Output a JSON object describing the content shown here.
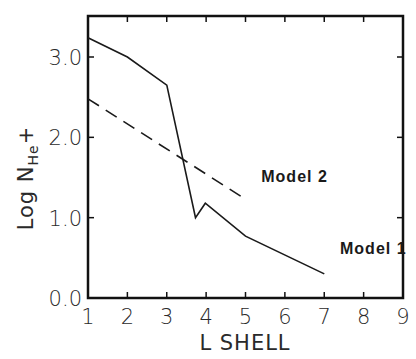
{
  "chart_data": {
    "type": "line",
    "title": "",
    "xlabel": "L SHELL",
    "ylabel": "Log N_He+",
    "ylabel_parts": {
      "prefix": "Log N",
      "subscript": "He",
      "suffix": "+"
    },
    "xlim": [
      1,
      9
    ],
    "ylim": [
      0.0,
      3.4
    ],
    "x_ticks": [
      "1",
      "2",
      "3",
      "4",
      "5",
      "6",
      "7",
      "8",
      "9"
    ],
    "y_ticks": [
      "0.0",
      "1.0",
      "2.0",
      "3.0"
    ],
    "grid": false,
    "legend": "none (inline annotations)",
    "series": [
      {
        "name": "Model 1",
        "style": "solid",
        "x": [
          1.0,
          2.0,
          3.0,
          3.73,
          3.98,
          5.0,
          7.0
        ],
        "y": [
          3.24,
          3.0,
          2.65,
          1.0,
          1.18,
          0.77,
          0.3
        ]
      },
      {
        "name": "Model 2",
        "style": "dashed",
        "x": [
          1.0,
          5.0
        ],
        "y": [
          2.48,
          1.23
        ]
      }
    ],
    "annotations": [
      {
        "text": "Model 2",
        "x": 5.4,
        "y": 1.45
      },
      {
        "text": "Model 1",
        "x": 7.4,
        "y": 0.55
      }
    ]
  }
}
